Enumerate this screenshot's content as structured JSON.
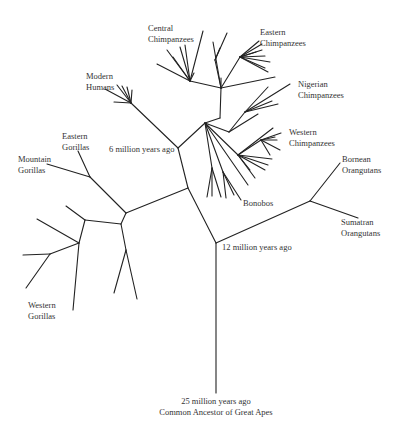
{
  "diagram": {
    "type": "phylogenetic-tree",
    "line_color": "#222222",
    "text_color": "#333333",
    "root": {
      "time": "25 million years ago",
      "label": "Common Ancestor of Great Apes"
    },
    "nodes": {
      "orangutan_split": "12 million years ago",
      "human_chimp_split": "6 million years ago"
    },
    "taxa": {
      "central_chimps": [
        "Central",
        "Chimpanzees"
      ],
      "eastern_chimps": [
        "Eastern",
        "Chimpanzees"
      ],
      "nigerian_chimps": [
        "Nigerian",
        "Chimpanzees"
      ],
      "western_chimps": [
        "Western",
        "Chimpanzees"
      ],
      "bonobos": [
        "Bonobos"
      ],
      "modern_humans": [
        "Modern",
        "Humans"
      ],
      "eastern_gorillas": [
        "Eastern",
        "Gorillas"
      ],
      "mountain_gorillas": [
        "Mountain",
        "Gorillas"
      ],
      "western_gorillas": [
        "Western",
        "Gorillas"
      ],
      "bornean_orangutans": [
        "Bornean",
        "Orangutans"
      ],
      "sumatran_orangutans": [
        "Sumatran",
        "Orangutans"
      ]
    }
  }
}
